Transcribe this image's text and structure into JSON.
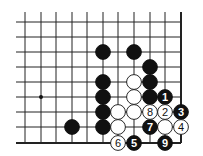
{
  "diagram": {
    "type": "go-board-fragment",
    "grid": {
      "x": [
        25,
        41,
        56,
        72,
        87,
        103,
        118,
        134,
        150,
        165,
        181
      ],
      "y": [
        22,
        37,
        52,
        67,
        82,
        97,
        112,
        127,
        143
      ],
      "x_start": 16,
      "y_start": 12,
      "right_edge": true,
      "bottom_edge": true
    },
    "star_points": [
      {
        "col": 1,
        "row": 5
      }
    ],
    "stones": [
      {
        "color": "black",
        "col": 5,
        "row": 2,
        "label": ""
      },
      {
        "color": "black",
        "col": 7,
        "row": 2,
        "label": ""
      },
      {
        "color": "black",
        "col": 8,
        "row": 3,
        "label": ""
      },
      {
        "color": "black",
        "col": 5,
        "row": 4,
        "label": ""
      },
      {
        "color": "black",
        "col": 8,
        "row": 4,
        "label": ""
      },
      {
        "color": "black",
        "col": 5,
        "row": 5,
        "label": ""
      },
      {
        "color": "black",
        "col": 8,
        "row": 5,
        "label": ""
      },
      {
        "color": "black",
        "col": 5,
        "row": 6,
        "label": ""
      },
      {
        "color": "black",
        "col": 5,
        "row": 7,
        "label": ""
      },
      {
        "color": "black",
        "col": 3,
        "row": 7,
        "label": ""
      },
      {
        "color": "white",
        "col": 7,
        "row": 4,
        "label": ""
      },
      {
        "color": "white",
        "col": 7,
        "row": 5,
        "label": ""
      },
      {
        "color": "white",
        "col": 6,
        "row": 6,
        "label": ""
      },
      {
        "color": "white",
        "col": 7,
        "row": 6,
        "label": ""
      },
      {
        "color": "white",
        "col": 6,
        "row": 7,
        "label": ""
      },
      {
        "color": "white",
        "col": 9,
        "row": 7,
        "label": ""
      },
      {
        "color": "black",
        "col": 9,
        "row": 5,
        "label": "1"
      },
      {
        "color": "white",
        "col": 9,
        "row": 6,
        "label": "2"
      },
      {
        "color": "black",
        "col": 10,
        "row": 6,
        "label": "3"
      },
      {
        "color": "white",
        "col": 10,
        "row": 7,
        "label": "4"
      },
      {
        "color": "black",
        "col": 7,
        "row": 8,
        "label": "5"
      },
      {
        "color": "white",
        "col": 6,
        "row": 8,
        "label": "6"
      },
      {
        "color": "black",
        "col": 8,
        "row": 7,
        "label": "7"
      },
      {
        "color": "white",
        "col": 8,
        "row": 6,
        "label": "8"
      },
      {
        "color": "black",
        "col": 9,
        "row": 8,
        "label": "9"
      }
    ],
    "colors": {
      "line": "#222222",
      "black": "#111111",
      "white": "#ffffff"
    }
  }
}
